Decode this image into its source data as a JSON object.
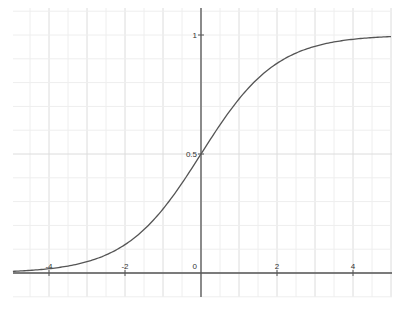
{
  "chart_data": {
    "type": "line",
    "title": "",
    "xlabel": "",
    "ylabel": "",
    "xlim": [
      -5.05,
      5.0
    ],
    "ylim": [
      -0.1,
      1.12
    ],
    "grid": true,
    "legend": null,
    "x_ticks": [
      -4,
      -2,
      0,
      2,
      4
    ],
    "x_tick_labels": [
      "-4",
      "-2",
      "0",
      "2",
      "4"
    ],
    "y_ticks": [
      0.5,
      1
    ],
    "y_tick_labels": [
      "0.5",
      "1"
    ],
    "series": [
      {
        "name": "logistic sigmoid 1/(1+e^-x)",
        "x": [
          -5,
          -4,
          -3,
          -2,
          -1,
          0,
          1,
          2,
          3,
          4,
          5
        ],
        "values": [
          0.0067,
          0.018,
          0.047,
          0.119,
          0.269,
          0.5,
          0.731,
          0.881,
          0.953,
          0.982,
          0.993
        ]
      }
    ],
    "colors": {
      "curve": "#555555",
      "axis": "#555555",
      "grid": "#e6e6e6",
      "background": "#ffffff"
    }
  }
}
